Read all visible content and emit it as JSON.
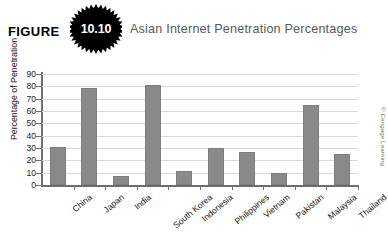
{
  "header": {
    "figure_word": "FIGURE",
    "badge_number": "10.10",
    "badge_icon": "starburst-badge",
    "title": "Asian Internet Penetration Percentages"
  },
  "credit": "© Cengage Learning",
  "chart_data": {
    "type": "bar",
    "title": "Asian Internet Penetration Percentages",
    "xlabel": "",
    "ylabel": "Percentage of Penetration",
    "ylim": [
      0,
      90
    ],
    "ytick_step": 10,
    "yticks": [
      90,
      80,
      70,
      60,
      50,
      40,
      30,
      20,
      10,
      0
    ],
    "grid": true,
    "legend": false,
    "bar_color": "#898989",
    "categories": [
      "China",
      "Japan",
      "India",
      "South Korea",
      "Indonesia",
      "Philippines",
      "Vietnam",
      "Pakistan",
      "Malaysia",
      "Thailand"
    ],
    "values": [
      31,
      79,
      7,
      81,
      11,
      30,
      27,
      10,
      65,
      25
    ]
  }
}
